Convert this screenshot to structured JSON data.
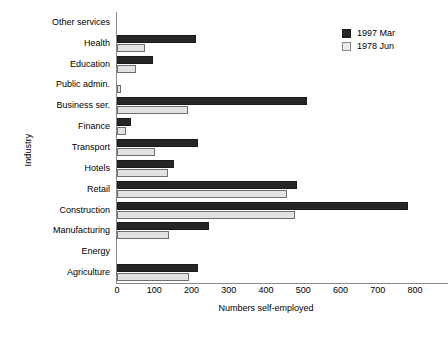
{
  "chart_data": {
    "type": "bar",
    "orientation": "horizontal",
    "title": "",
    "xlabel": "Numbers self-employed",
    "ylabel": "Industry",
    "xlim": [
      0,
      800
    ],
    "xticks": [
      0,
      100,
      200,
      300,
      400,
      500,
      600,
      700,
      800
    ],
    "grid": false,
    "legend_position": "top-right",
    "categories": [
      "Other services",
      "Health",
      "Education",
      "Public admin.",
      "Business ser.",
      "Finance",
      "Transport",
      "Hotels",
      "Retail",
      "Construction",
      "Manufacturing",
      "Energy",
      "Agriculture"
    ],
    "series": [
      {
        "name": "1997 Mar",
        "color": "#262626",
        "values": [
          0,
          212,
          96,
          0,
          510,
          38,
          218,
          152,
          482,
          782,
          246,
          0,
          218
        ]
      },
      {
        "name": "1978 Jun",
        "color": "#e2e2e2",
        "values": [
          0,
          74,
          50,
          12,
          190,
          24,
          102,
          138,
          456,
          478,
          140,
          0,
          194
        ]
      }
    ]
  },
  "legend": {
    "items": [
      {
        "label": "1997 Mar",
        "swatch": "dark"
      },
      {
        "label": "1978 Jun",
        "swatch": "light"
      }
    ]
  }
}
